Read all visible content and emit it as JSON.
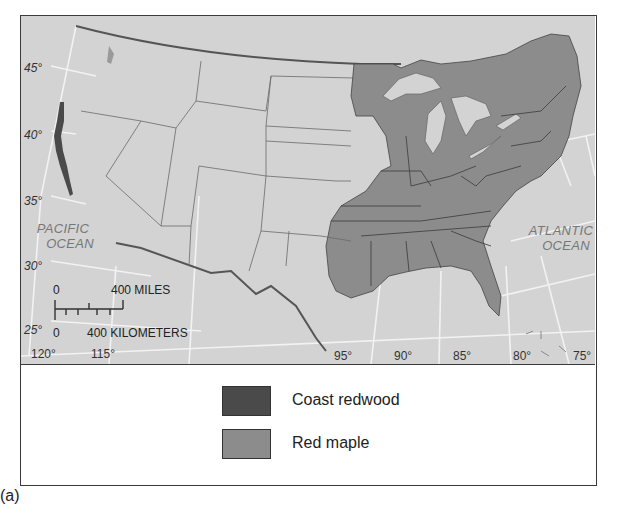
{
  "figure": {
    "caption": "(a)",
    "map": {
      "ocean_labels": {
        "pacific": [
          "PACIFIC",
          "OCEAN"
        ],
        "atlantic": [
          "ATLANTIC",
          "OCEAN"
        ]
      },
      "latitude_labels": [
        "45°",
        "40°",
        "35°",
        "30°",
        "25°"
      ],
      "longitude_labels": [
        "120°",
        "115°",
        "95°",
        "90°",
        "85°",
        "80°",
        "75°"
      ],
      "scale_bar": {
        "miles_zero": "0",
        "miles_label": "400 MILES",
        "km_zero": "0",
        "km_label": "400 KILOMETERS"
      },
      "colors": {
        "land_background": "#d3d3d3",
        "coast_redwood": "#4a4a4a",
        "red_maple": "#8c8c8c",
        "lakes": "#d3d3d3",
        "graticule": "#f4f4f4",
        "border": "#5a5a5a"
      }
    },
    "legend": {
      "items": [
        {
          "label": "Coast redwood",
          "color": "#4a4a4a"
        },
        {
          "label": "Red maple",
          "color": "#8c8c8c"
        }
      ]
    }
  }
}
